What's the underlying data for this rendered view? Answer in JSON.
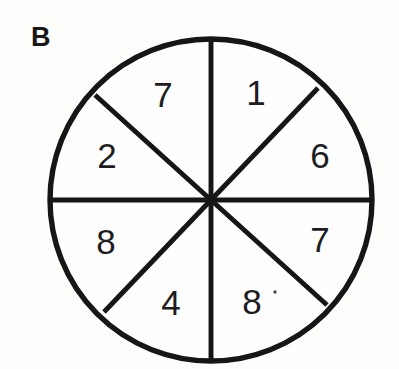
{
  "figure": {
    "panel_label": "B",
    "type": "sector-wheel",
    "background_color": "#fdfdfc",
    "ink_color": "#161618"
  },
  "wheel": {
    "center_x": 211,
    "center_y": 200,
    "radius": 161,
    "sector_count": 8,
    "outline_stroke_width": 5.4,
    "spoke_stroke_width": 4.9
  },
  "chart_data": {
    "type": "pie",
    "title": "B",
    "xlabel": "",
    "ylabel": "",
    "legend": [],
    "grid": false,
    "equal_sectors": false,
    "categories": [
      "sector-top-right",
      "sector-right-upper",
      "sector-right-lower",
      "sector-bottom-right",
      "sector-bottom-left",
      "sector-left-lower",
      "sector-left-upper",
      "sector-top-left"
    ],
    "labels": [
      "1",
      "6",
      "7",
      "8",
      "4",
      "8",
      "2",
      "7"
    ],
    "values": [
      1,
      6,
      7,
      8,
      4,
      8,
      2,
      7
    ],
    "sector_boundaries_deg": [
      90,
      62,
      0,
      -62,
      -90,
      -118,
      180,
      118
    ],
    "label_positions": [
      {
        "text": "1",
        "x": 256,
        "y": 96
      },
      {
        "text": "6",
        "x": 320,
        "y": 159
      },
      {
        "text": "7",
        "x": 320,
        "y": 243
      },
      {
        "text": "8",
        "x": 252,
        "y": 305
      },
      {
        "text": "4",
        "x": 171,
        "y": 306
      },
      {
        "text": "8",
        "x": 106,
        "y": 245
      },
      {
        "text": "2",
        "x": 107,
        "y": 159
      },
      {
        "text": "7",
        "x": 163,
        "y": 98
      }
    ]
  },
  "spokes": [
    {
      "name": "vertical-diameter",
      "x1": 211,
      "y1": 39,
      "x2": 211,
      "y2": 361
    },
    {
      "name": "horizontal-diameter",
      "x1": 50,
      "y1": 200,
      "x2": 372,
      "y2": 200
    },
    {
      "name": "diagonal-nw-se",
      "x1": 95,
      "y1": 95,
      "x2": 327,
      "y2": 305
    },
    {
      "name": "diagonal-ne-sw",
      "x1": 318,
      "y1": 88,
      "x2": 104,
      "y2": 312
    }
  ],
  "artifacts": [
    {
      "name": "scan-speck",
      "x": 275,
      "y": 292,
      "r": 1.7
    }
  ]
}
